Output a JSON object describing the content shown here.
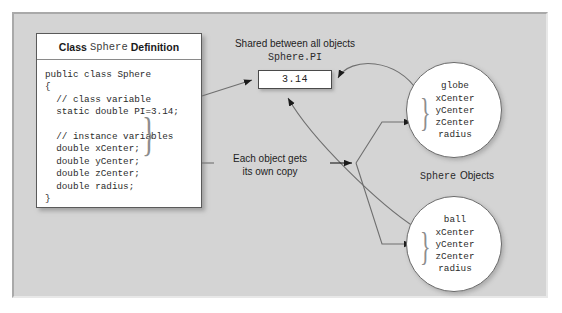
{
  "panel": {
    "background_color": "#d4d4d4"
  },
  "class_box": {
    "header": {
      "prefix": "Class",
      "class_name": "Sphere",
      "suffix": "Definition"
    },
    "code": "public class Sphere\n{\n  // class variable\n  static double PI=3.14;\n\n  // instance variables\n  double xCenter;\n  double yCenter;\n  double zCenter;\n  double radius;\n}",
    "brace_glyph": "}"
  },
  "shared": {
    "label": "Shared between all objects",
    "variable_name": "Sphere.PI",
    "value": "3.14"
  },
  "copy_note": {
    "line1": "Each object gets",
    "line2": "its own copy"
  },
  "objects_label": {
    "class_name": "Sphere",
    "suffix": "Objects"
  },
  "objects": [
    {
      "name": "globe",
      "fields": "xCenter\nyCenter\nzCenter\nradius",
      "brace_glyph": "}"
    },
    {
      "name": "ball",
      "fields": "xCenter\nyCenter\nzCenter\nradius",
      "brace_glyph": "}"
    }
  ]
}
